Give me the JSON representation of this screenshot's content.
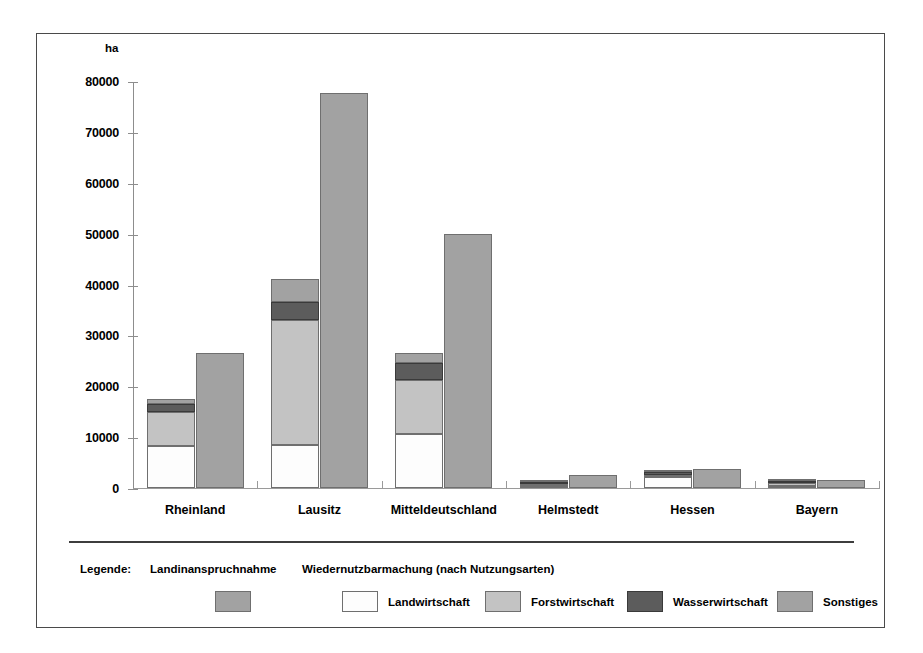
{
  "unit_label": "ha",
  "legend": {
    "word": "Legende:",
    "heading_left": "Landinanspruchnahme",
    "heading_right": "Wiedernutzbarmachung (nach Nutzungsarten)",
    "entries": [
      {
        "label": "Landwirtschaft",
        "color": "#fdfdfd"
      },
      {
        "label": "Forstwirtschaft",
        "color": "#c3c3c3"
      },
      {
        "label": "Wasserwirtschaft",
        "color": "#5c5c5c"
      },
      {
        "label": "Sonstiges",
        "color": "#a2a2a2"
      }
    ],
    "landinanspruchnahme_color": "#a2a2a2"
  },
  "chart_data": {
    "type": "bar",
    "title": "",
    "subtitle": "",
    "xlabel": "",
    "ylabel": "ha",
    "ylim": [
      0,
      80000
    ],
    "ytick_step": 10000,
    "yticks": [
      0,
      10000,
      20000,
      30000,
      40000,
      50000,
      60000,
      70000,
      80000
    ],
    "ytick_labels": [
      "0",
      "10000",
      "20000",
      "30000",
      "40000",
      "50000",
      "60000",
      "70000",
      "80000"
    ],
    "grid": false,
    "legend_position": "bottom",
    "grouping": "grouped-with-stacked-left-bar",
    "categories": [
      "Rheinland",
      "Lausitz",
      "Mitteldeutschland",
      "Helmstedt",
      "Hessen",
      "Bayern"
    ],
    "series": [
      {
        "name": "Landwirtschaft",
        "stack": "Wiedernutzbarmachung",
        "color": "#fdfdfd",
        "values": [
          8200,
          8500,
          10700,
          400,
          2100,
          300
        ]
      },
      {
        "name": "Forstwirtschaft",
        "stack": "Wiedernutzbarmachung",
        "color": "#c3c3c3",
        "values": [
          6700,
          24500,
          10500,
          400,
          200,
          500
        ]
      },
      {
        "name": "Wasserwirtschaft",
        "stack": "Wiedernutzbarmachung",
        "color": "#5c5c5c",
        "values": [
          1600,
          3500,
          3300,
          300,
          700,
          400
        ]
      },
      {
        "name": "Sonstiges",
        "stack": "Wiedernutzbarmachung",
        "color": "#a2a2a2",
        "values": [
          1000,
          4500,
          2000,
          200,
          200,
          300
        ]
      },
      {
        "name": "Landinanspruchnahme",
        "stack": "Landinanspruchnahme",
        "color": "#a2a2a2",
        "values": [
          26500,
          77700,
          50000,
          2500,
          3700,
          1500
        ]
      }
    ],
    "stack_totals_wiedernutzbarmachung": [
      17500,
      41000,
      26500,
      1300,
      3200,
      1500
    ]
  }
}
